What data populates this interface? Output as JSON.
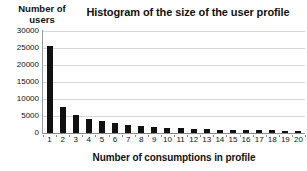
{
  "chart_data": {
    "type": "bar",
    "title": "Histogram of the size of the user profile",
    "xlabel": "Number of consumptions in profile",
    "ylabel": "Number of users",
    "ylabel_lines": [
      "Number of",
      "users"
    ],
    "categories": [
      "1",
      "2",
      "3",
      "4",
      "5",
      "6",
      "7",
      "8",
      "9",
      "10",
      "11",
      "12",
      "13",
      "14",
      "15",
      "16",
      "17",
      "18",
      "19",
      "20"
    ],
    "values": [
      25500,
      7700,
      5200,
      4200,
      3500,
      2900,
      2400,
      2000,
      1700,
      1500,
      1400,
      1200,
      1100,
      1000,
      950,
      900,
      800,
      750,
      700,
      650
    ],
    "ylim": [
      0,
      30000
    ],
    "ytick_labels": [
      "0",
      "5000",
      "10000",
      "15000",
      "20000",
      "25000",
      "30000"
    ],
    "ytick_values": [
      0,
      5000,
      10000,
      15000,
      20000,
      25000,
      30000
    ],
    "grid": true,
    "legend": "none",
    "bar_color": "#111111",
    "gridline_color": "#d6d6d6",
    "axis_color": "#8a8a8a",
    "background_color": "#ffffff"
  }
}
